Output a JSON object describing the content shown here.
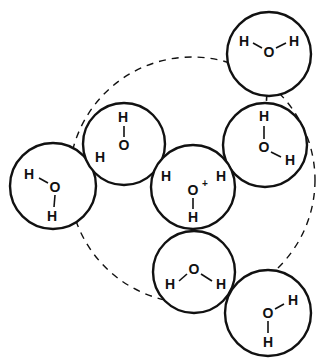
{
  "figure": {
    "background_color": "#ffffff",
    "line_color": "#111111",
    "width": 325,
    "height": 364
  },
  "hydration_shell": {
    "label": "hydration-shell-circle",
    "cx": 192,
    "cy": 180,
    "r": 123,
    "style": "dashed"
  },
  "molecules": [
    {
      "id": "central-hydronium",
      "species": "H3O+",
      "cx": 193,
      "cy": 187,
      "r": 42,
      "charged": true,
      "charge_symbol": "+",
      "oxygen": {
        "label": "O",
        "x": 193,
        "y": 190
      },
      "hydrogens": [
        {
          "label": "H",
          "x": 166,
          "y": 176
        },
        {
          "label": "H",
          "x": 221,
          "y": 176
        },
        {
          "label": "H",
          "x": 193,
          "y": 217
        }
      ]
    },
    {
      "id": "water-left",
      "species": "H2O",
      "cx": 53,
      "cy": 186,
      "r": 43,
      "charged": false,
      "oxygen": {
        "label": "O",
        "x": 55,
        "y": 187
      },
      "hydrogens": [
        {
          "label": "H",
          "x": 29,
          "y": 174
        },
        {
          "label": "H",
          "x": 52,
          "y": 216
        }
      ]
    },
    {
      "id": "water-upper-left",
      "species": "H2O",
      "cx": 124,
      "cy": 144,
      "r": 41,
      "charged": false,
      "oxygen": {
        "label": "O",
        "x": 124,
        "y": 145
      },
      "hydrogens": [
        {
          "label": "H",
          "x": 123,
          "y": 117
        },
        {
          "label": "H",
          "x": 100,
          "y": 157
        }
      ]
    },
    {
      "id": "water-top-right",
      "species": "H2O",
      "cx": 269,
      "cy": 54,
      "r": 42,
      "charged": false,
      "oxygen": {
        "label": "O",
        "x": 269,
        "y": 52
      },
      "hydrogens": [
        {
          "label": "H",
          "x": 244,
          "y": 41
        },
        {
          "label": "H",
          "x": 294,
          "y": 41
        }
      ]
    },
    {
      "id": "water-right",
      "species": "H2O",
      "cx": 265,
      "cy": 145,
      "r": 42,
      "charged": false,
      "oxygen": {
        "label": "O",
        "x": 264,
        "y": 147
      },
      "hydrogens": [
        {
          "label": "H",
          "x": 264,
          "y": 116
        },
        {
          "label": "H",
          "x": 290,
          "y": 160
        }
      ]
    },
    {
      "id": "water-bottom-middle",
      "species": "H2O",
      "cx": 194,
      "cy": 272,
      "r": 41,
      "charged": false,
      "oxygen": {
        "label": "O",
        "x": 194,
        "y": 269
      },
      "hydrogens": [
        {
          "label": "H",
          "x": 170,
          "y": 284
        },
        {
          "label": "H",
          "x": 221,
          "y": 284
        }
      ]
    },
    {
      "id": "water-bottom-right",
      "species": "H2O",
      "cx": 268,
      "cy": 313,
      "r": 43,
      "charged": false,
      "oxygen": {
        "label": "O",
        "x": 268,
        "y": 313
      },
      "hydrogens": [
        {
          "label": "H",
          "x": 293,
          "y": 300
        },
        {
          "label": "H",
          "x": 268,
          "y": 342
        }
      ]
    }
  ],
  "covalent_bonds": [
    {
      "from": "central-hydronium.O",
      "x1": 193,
      "y1": 182,
      "x2": 193,
      "y2": 208
    },
    {
      "from": "water-upper-left.O",
      "x1": 124,
      "y1": 137,
      "x2": 124,
      "y2": 126
    },
    {
      "from": "water-top-right.O",
      "x1": 262,
      "y1": 48,
      "x2": 252,
      "y2": 43
    },
    {
      "from": "water-top-right.O2",
      "x1": 276,
      "y1": 48,
      "x2": 287,
      "y2": 43
    },
    {
      "from": "water-right.O",
      "x1": 264,
      "y1": 140,
      "x2": 264,
      "y2": 125
    },
    {
      "from": "water-right.O2",
      "x1": 271,
      "y1": 152,
      "x2": 282,
      "y2": 157
    },
    {
      "from": "water-bottom-middle.O",
      "x1": 187,
      "y1": 274,
      "x2": 178,
      "y2": 281
    },
    {
      "from": "water-bottom-middle.O2",
      "x1": 201,
      "y1": 274,
      "x2": 212,
      "y2": 281
    },
    {
      "from": "water-bottom-right.O",
      "x1": 275,
      "y1": 309,
      "x2": 285,
      "y2": 304
    },
    {
      "from": "water-bottom-right.O2",
      "x1": 268,
      "y1": 320,
      "x2": 268,
      "y2": 334
    },
    {
      "from": "water-left.O",
      "x1": 55,
      "y1": 194,
      "x2": 54,
      "y2": 208
    },
    {
      "from": "water-left.O2",
      "x1": 48,
      "y1": 183,
      "x2": 38,
      "y2": 178
    }
  ],
  "hydrogen_bonds": [
    {
      "label": "hbond-hydronium-to-upper-left",
      "x1": 159,
      "y1": 172,
      "x2": 132,
      "y2": 156
    },
    {
      "label": "hbond-hydronium-to-right",
      "x1": 228,
      "y1": 172,
      "x2": 254,
      "y2": 153
    },
    {
      "label": "hbond-hydronium-to-bottom-middle",
      "x1": 193,
      "y1": 224,
      "x2": 193,
      "y2": 258
    },
    {
      "label": "hbond-upper-left-to-left",
      "x1": 93,
      "y1": 160,
      "x2": 64,
      "y2": 181
    },
    {
      "label": "hbond-top-right-to-right",
      "x1": 269,
      "y1": 60,
      "x2": 266,
      "y2": 108
    },
    {
      "label": "hbond-bottom-middle-to-bottom-right",
      "x1": 228,
      "y1": 287,
      "x2": 256,
      "y2": 308
    }
  ],
  "legend": {
    "solid_circle_meaning": "water molecule van der Waals sphere",
    "dashed_line_meaning": "hydrogen bond",
    "dashed_circle_meaning": "first hydration shell boundary"
  }
}
